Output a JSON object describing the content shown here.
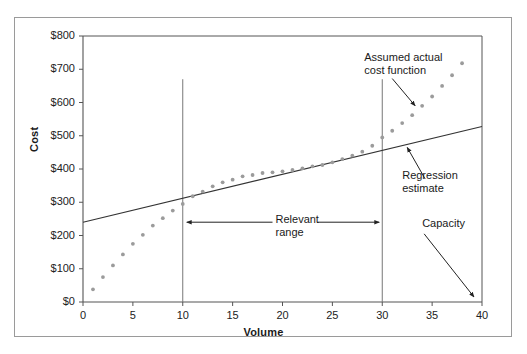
{
  "chart_data": {
    "type": "scatter",
    "title": "",
    "xlabel": "Volume",
    "ylabel": "Cost",
    "xlim": [
      0,
      40
    ],
    "ylim": [
      0,
      800
    ],
    "xticks": [
      0,
      5,
      10,
      15,
      20,
      25,
      30,
      35,
      40
    ],
    "xtick_labels": [
      "0",
      "5",
      "10",
      "15",
      "20",
      "25",
      "30",
      "35",
      "40"
    ],
    "yticks": [
      0,
      100,
      200,
      300,
      400,
      500,
      600,
      700,
      800
    ],
    "ytick_labels": [
      "$0",
      "$100",
      "$200",
      "$300",
      "$400",
      "$500",
      "$600",
      "$700",
      "$800"
    ],
    "grid": false,
    "legend": "none",
    "series": [
      {
        "name": "Assumed actual cost function",
        "type": "scatter",
        "marker_color": "#9b9b9b",
        "x": [
          1,
          2,
          3,
          4,
          5,
          6,
          7,
          8,
          9,
          10,
          11,
          12,
          13,
          14,
          15,
          16,
          17,
          18,
          19,
          20,
          21,
          22,
          23,
          24,
          25,
          26,
          27,
          28,
          29,
          30,
          31,
          32,
          33,
          34,
          35,
          36,
          37,
          38
        ],
        "y": [
          38,
          75,
          110,
          143,
          175,
          202,
          230,
          252,
          275,
          295,
          318,
          332,
          348,
          360,
          368,
          378,
          382,
          388,
          390,
          393,
          397,
          402,
          408,
          412,
          420,
          430,
          440,
          452,
          470,
          495,
          515,
          538,
          562,
          590,
          618,
          650,
          682,
          718
        ]
      },
      {
        "name": "Regression estimate",
        "type": "line",
        "line_color": "#333333",
        "x": [
          0,
          40
        ],
        "y": [
          240,
          528
        ],
        "intercept": 240,
        "slope": 7.2
      }
    ],
    "vertical_markers": [
      {
        "label": "relevant-range-lower",
        "x": 10,
        "y_top": 670,
        "y_bottom": 0
      },
      {
        "label": "relevant-range-upper",
        "x": 30,
        "y_top": 670,
        "y_bottom": 0
      }
    ],
    "annotations": [
      {
        "name": "assumed-actual-cost-function",
        "text_line1": "Assumed actual",
        "text_line2": "cost function",
        "points_to_x": 33.3,
        "points_to_y": 590
      },
      {
        "name": "regression-estimate",
        "text_line1": "Regression",
        "text_line2": "estimate",
        "points_to_x": 32.5,
        "points_to_y": 465
      },
      {
        "name": "relevant-range",
        "text_line1": "Relevant",
        "text_line2": "range",
        "span_from_x": 10,
        "span_to_x": 30,
        "at_y": 240
      },
      {
        "name": "capacity",
        "text_line1": "Capacity",
        "text_line2": "",
        "points_to_x": 39.2,
        "points_to_y": 15
      }
    ]
  },
  "labels": {
    "x_axis_title": "Volume",
    "y_axis_title": "Cost",
    "assumed_actual_line1": "Assumed actual",
    "assumed_actual_line2": "cost function",
    "regression_line1": "Regression",
    "regression_line2": "estimate",
    "relevant_range_line1": "Relevant",
    "relevant_range_line2": "range",
    "capacity": "Capacity"
  },
  "colors": {
    "marker": "#9b9b9b",
    "line": "#333333",
    "axis": "#555555",
    "frame": "#9a9a9a",
    "text": "#1a1a1a"
  }
}
